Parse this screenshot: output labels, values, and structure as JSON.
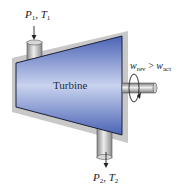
{
  "diagram": {
    "title": "Turbine",
    "device_label": "Turbine",
    "inlet": {
      "pressure_symbol": "P",
      "pressure_sub": "1",
      "temperature_symbol": "T",
      "temperature_sub": "1",
      "separator": ", "
    },
    "outlet": {
      "pressure_symbol": "P",
      "pressure_sub": "2",
      "temperature_symbol": "T",
      "temperature_sub": "2",
      "separator": ", "
    },
    "work_relation": {
      "lhs_symbol": "w",
      "lhs_sub": "rev",
      "operator": " > ",
      "rhs_symbol": "w",
      "rhs_sub": "act"
    },
    "icons": [
      "inlet-arrow-icon",
      "outlet-arrow-icon",
      "rotation-arrow-icon",
      "shaft-icon",
      "pipe-icon"
    ],
    "colors": {
      "body_dark": "#4a63b5",
      "body_light": "#c9d3ef",
      "body_outline": "#1a2038",
      "backing_gray": "#c8c8c8",
      "pipe_gray": "#a8a8a8",
      "pipe_highlight": "#e8e8e8",
      "text": "#1a1a1a"
    }
  }
}
